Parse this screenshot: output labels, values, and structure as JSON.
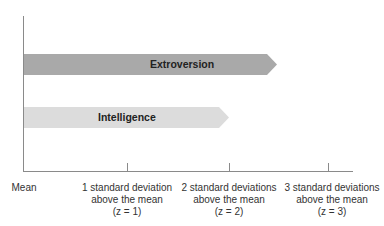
{
  "bars": [
    {
      "label": "Extroversion",
      "color": "#a9a9a9",
      "extent_z": 1.5
    },
    {
      "label": "Intelligence",
      "color": "#dcdcdc",
      "extent_z": 1.0
    }
  ],
  "axis": {
    "origin_label": "Mean",
    "ticks": [
      {
        "line1": "1 standard deviation",
        "line2": "above the mean",
        "line3": "(z = 1)"
      },
      {
        "line1": "2 standard deviations",
        "line2": "above the mean",
        "line3": "(z = 2)"
      },
      {
        "line1": "3 standard deviations",
        "line2": "above the mean",
        "line3": "(z = 3)"
      }
    ]
  }
}
